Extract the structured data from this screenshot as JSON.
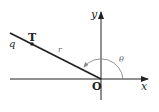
{
  "diagram": {
    "labels": {
      "x_axis": "x",
      "y_axis": "y",
      "origin": "O",
      "point": "T",
      "ray": "q",
      "distance": "r",
      "angle": "θ"
    },
    "colors": {
      "line": "#222222",
      "arc": "#888888"
    }
  }
}
